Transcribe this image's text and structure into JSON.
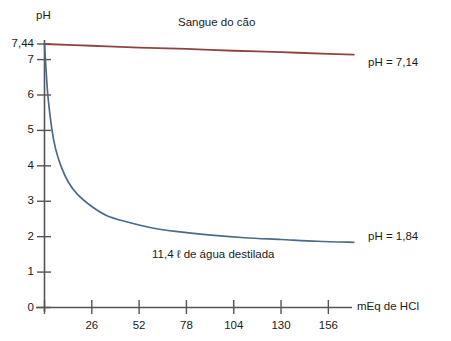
{
  "chart_data": {
    "type": "line",
    "title": "",
    "subtitle": "",
    "xlabel": "mEq de HCl",
    "ylabel": "pH",
    "xlim": [
      0,
      169
    ],
    "ylim": [
      0,
      7.44
    ],
    "grid": false,
    "legend_position": "inline-right",
    "x_ticks": [
      {
        "value": 0,
        "label": ""
      },
      {
        "value": 26,
        "label": "26"
      },
      {
        "value": 52,
        "label": "52"
      },
      {
        "value": 78,
        "label": "78"
      },
      {
        "value": 104,
        "label": "104"
      },
      {
        "value": 130,
        "label": "130"
      },
      {
        "value": 156,
        "label": "156"
      }
    ],
    "y_ticks": [
      {
        "value": 7.44,
        "label": "7,44"
      },
      {
        "value": 7,
        "label": "7"
      },
      {
        "value": 6,
        "label": "6"
      },
      {
        "value": 5,
        "label": "5"
      },
      {
        "value": 4,
        "label": "4"
      },
      {
        "value": 3,
        "label": "3"
      },
      {
        "value": 2,
        "label": "2"
      },
      {
        "value": 1,
        "label": "1"
      },
      {
        "value": 0,
        "label": "0"
      }
    ],
    "series": [
      {
        "name": "Sangue do cão",
        "color": "#8f4440",
        "end_label": "pH = 7,14",
        "start_value": 7.44,
        "end_value": 7.14,
        "x": [
          0,
          26,
          52,
          78,
          104,
          130,
          156,
          170
        ],
        "values": [
          7.44,
          7.39,
          7.34,
          7.3,
          7.25,
          7.21,
          7.16,
          7.14
        ]
      },
      {
        "name": "11,4 ℓ de água destilada",
        "color": "#4a6b8a",
        "end_label": "pH = 1,84",
        "start_value": 7.44,
        "end_value": 1.84,
        "x": [
          0,
          1,
          2,
          4,
          6,
          9,
          13,
          18,
          26,
          34,
          45,
          58,
          72,
          90,
          110,
          130,
          150,
          170
        ],
        "values": [
          7.44,
          6.6,
          5.9,
          5.05,
          4.5,
          4.0,
          3.55,
          3.2,
          2.85,
          2.6,
          2.42,
          2.26,
          2.15,
          2.05,
          1.97,
          1.92,
          1.87,
          1.84
        ]
      }
    ],
    "annotations": [
      {
        "text": "Sangue do cão",
        "x_px": 178,
        "y_px": 22
      },
      {
        "text": "11,4 ℓ de água destilada",
        "x_px": 152,
        "y_px": 250
      }
    ]
  },
  "axes": {
    "y_axis_title": "pH",
    "x_axis_title": "mEq de HCl"
  },
  "colors": {
    "blood_line": "#8f4440",
    "water_line": "#4a6b8a",
    "axis": "#555555",
    "text": "#1a1a1a",
    "background": "#ffffff"
  }
}
